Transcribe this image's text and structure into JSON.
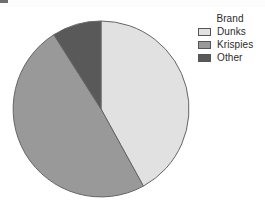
{
  "background_color": "#ffffff",
  "legend": {
    "title": "Brand",
    "position": "right",
    "items": [
      {
        "label": "Dunks",
        "color": "#e1e1e1",
        "swatch_name": "legend-swatch-dunks"
      },
      {
        "label": "Krispies",
        "color": "#999999",
        "swatch_name": "legend-swatch-krispies"
      },
      {
        "label": "Other",
        "color": "#595959",
        "swatch_name": "legend-swatch-other"
      }
    ]
  },
  "chart_data": {
    "type": "pie",
    "title": "",
    "legend_title": "Brand",
    "legend_position": "right",
    "grid": false,
    "categories": [
      "Dunks",
      "Krispies",
      "Other"
    ],
    "values": [
      42,
      49,
      9
    ],
    "unit": "percent",
    "colors": [
      "#e1e1e1",
      "#999999",
      "#595959"
    ],
    "start_angle_deg": 90,
    "direction": "clockwise",
    "slice_angles_deg": [
      151.2,
      176.4,
      32.4
    ],
    "outline_color": "#666666",
    "center_px": [
      101,
      109
    ],
    "radius_px": 88
  }
}
